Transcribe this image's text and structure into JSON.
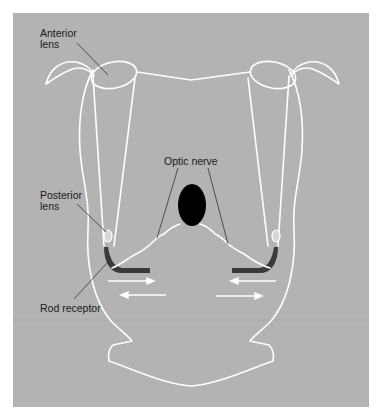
{
  "figure": {
    "background": "#ffffff",
    "panel_color": "#b3b3b3",
    "outline_color": "#ffffff",
    "receptor_color": "#3a3a3a",
    "optic_ball_color": "#000000"
  },
  "labels": {
    "anterior_lens": "Anterior\nlens",
    "anterior_lens_line1": "Anterior",
    "anterior_lens_line2": "lens",
    "posterior_lens_line1": "Posterior",
    "posterior_lens_line2": "lens",
    "optic_nerve": "Optic nerve",
    "rod_receptor": "Rod receptor"
  },
  "arrows": [
    {
      "side": "left",
      "upper": "right",
      "lower": "left"
    },
    {
      "side": "right",
      "upper": "left",
      "lower": "right"
    }
  ]
}
